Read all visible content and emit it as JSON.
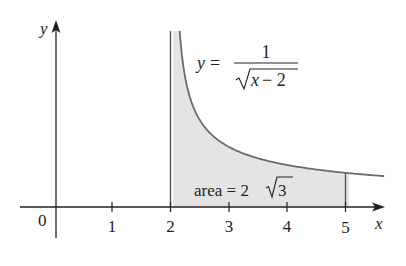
{
  "chart_data": {
    "type": "area",
    "title": "",
    "function_label": {
      "lhs": "y =",
      "numerator": "1",
      "denominator": "x − 2"
    },
    "area_label": {
      "prefix": "area = 2",
      "radicand": "3"
    },
    "xlabel": "x",
    "ylabel": "y",
    "origin_label": "0",
    "x_ticks": [
      "1",
      "2",
      "3",
      "4",
      "5"
    ],
    "xlim": [
      0,
      5.8
    ],
    "shaded_interval": [
      2,
      5
    ],
    "asymptote_x": 2,
    "area_value": "2√3",
    "colors": {
      "axis": "#231f20",
      "curve": "#6b6b6b",
      "fill": "#e4e4e4"
    }
  }
}
